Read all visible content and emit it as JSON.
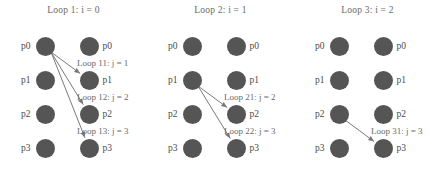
{
  "figure": {
    "title": "",
    "node_color": "#555555",
    "text_color": "#5a5a5a",
    "arrow_color": "#7a7a7a",
    "background": "#ffffff"
  },
  "panels": [
    {
      "title": "Loop 1: i = 0",
      "left_nodes": [
        "p0",
        "p1",
        "p2",
        "p3"
      ],
      "right_nodes": [
        "p0",
        "p1",
        "p2",
        "p3"
      ],
      "source_index": 0,
      "arrows": [
        {
          "label": "Loop 11: j = 1",
          "from": 0,
          "to": 1
        },
        {
          "label": "Loop 12: j = 2",
          "from": 0,
          "to": 2
        },
        {
          "label": "Loop 13: j = 3",
          "from": 0,
          "to": 3
        }
      ]
    },
    {
      "title": "Loop 2: i = 1",
      "left_nodes": [
        "p0",
        "p1",
        "p2",
        "p3"
      ],
      "right_nodes": [
        "p0",
        "p1",
        "p2",
        "p3"
      ],
      "source_index": 1,
      "arrows": [
        {
          "label": "Loop 21: j = 2",
          "from": 1,
          "to": 2
        },
        {
          "label": "Loop 22: j = 3",
          "from": 1,
          "to": 3
        }
      ]
    },
    {
      "title": "Loop 3: i = 2",
      "left_nodes": [
        "p0",
        "p1",
        "p2",
        "p3"
      ],
      "right_nodes": [
        "p0",
        "p1",
        "p2",
        "p3"
      ],
      "source_index": 2,
      "arrows": [
        {
          "label": "Loop 31: j = 3",
          "from": 2,
          "to": 3
        }
      ]
    }
  ],
  "geometry": {
    "left_x": 45,
    "right_x": 89,
    "row_y": [
      46,
      80,
      114,
      148
    ],
    "node_r": 9.5
  }
}
